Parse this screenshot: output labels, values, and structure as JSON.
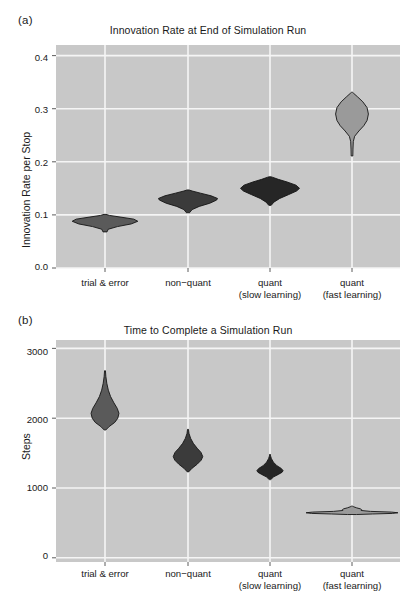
{
  "figure": {
    "background": "#ffffff",
    "panel_background": "#c8c8c8",
    "gridline_color": "#f5f5f5",
    "text_color": "#1a1a1a"
  },
  "panels": [
    {
      "tag": "(a)",
      "title": "Innovation Rate at End of Simulation Run",
      "ylabel": "Innovation Rate per Stop",
      "ytick_labels": [
        "0.4",
        "0.3",
        "0.2",
        "0.1",
        "0.0"
      ],
      "xtick_labels": [
        {
          "line1": "trial & error",
          "line2": ""
        },
        {
          "line1": "non−quant",
          "line2": ""
        },
        {
          "line1": "quant",
          "line2": "(slow learning)"
        },
        {
          "line1": "quant",
          "line2": "(fast learning)"
        }
      ]
    },
    {
      "tag": "(b)",
      "title": "Time to Complete a Simulation Run",
      "ylabel": "Steps",
      "ytick_labels": [
        "3000",
        "2000",
        "1000",
        "0"
      ],
      "xtick_labels": [
        {
          "line1": "trial & error",
          "line2": ""
        },
        {
          "line1": "non−quant",
          "line2": ""
        },
        {
          "line1": "quant",
          "line2": "(slow learning)"
        },
        {
          "line1": "quant",
          "line2": "(fast learning)"
        }
      ]
    }
  ],
  "chart_data": [
    {
      "type": "violin",
      "panel": "a",
      "title": "Innovation Rate at End of Simulation Run",
      "xlabel": "",
      "ylabel": "Innovation Rate per Stop",
      "ylim": [
        0.0,
        0.42
      ],
      "yticks": [
        0.0,
        0.1,
        0.2,
        0.3,
        0.4
      ],
      "grid": true,
      "legend": "none",
      "categories": [
        "trial & error",
        "non−quant",
        "quant (slow learning)",
        "quant (fast learning)"
      ],
      "violins": [
        {
          "name": "trial & error",
          "fill": "#5a5a5a",
          "min": 0.068,
          "max": 0.101,
          "median": 0.088,
          "half_width_max": 0.4,
          "profile": [
            {
              "v": 0.068,
              "w": 0.06
            },
            {
              "v": 0.073,
              "w": 0.1
            },
            {
              "v": 0.078,
              "w": 0.38
            },
            {
              "v": 0.083,
              "w": 0.8
            },
            {
              "v": 0.088,
              "w": 1.0
            },
            {
              "v": 0.092,
              "w": 0.88
            },
            {
              "v": 0.096,
              "w": 0.46
            },
            {
              "v": 0.099,
              "w": 0.14
            },
            {
              "v": 0.101,
              "w": 0.03
            }
          ]
        },
        {
          "name": "non−quant",
          "fill": "#3b3b3b",
          "min": 0.104,
          "max": 0.147,
          "median": 0.13,
          "half_width_max": 0.36,
          "profile": [
            {
              "v": 0.104,
              "w": 0.05
            },
            {
              "v": 0.11,
              "w": 0.14
            },
            {
              "v": 0.116,
              "w": 0.38
            },
            {
              "v": 0.122,
              "w": 0.74
            },
            {
              "v": 0.128,
              "w": 0.97
            },
            {
              "v": 0.131,
              "w": 1.0
            },
            {
              "v": 0.136,
              "w": 0.78
            },
            {
              "v": 0.141,
              "w": 0.42
            },
            {
              "v": 0.145,
              "w": 0.14
            },
            {
              "v": 0.147,
              "w": 0.03
            }
          ]
        },
        {
          "name": "quant (slow learning)",
          "fill": "#262626",
          "min": 0.118,
          "max": 0.172,
          "median": 0.15,
          "half_width_max": 0.36,
          "profile": [
            {
              "v": 0.118,
              "w": 0.04
            },
            {
              "v": 0.124,
              "w": 0.13
            },
            {
              "v": 0.131,
              "w": 0.33
            },
            {
              "v": 0.138,
              "w": 0.62
            },
            {
              "v": 0.145,
              "w": 0.9
            },
            {
              "v": 0.15,
              "w": 1.0
            },
            {
              "v": 0.156,
              "w": 0.88
            },
            {
              "v": 0.162,
              "w": 0.58
            },
            {
              "v": 0.167,
              "w": 0.28
            },
            {
              "v": 0.171,
              "w": 0.08
            },
            {
              "v": 0.172,
              "w": 0.02
            }
          ]
        },
        {
          "name": "quant (fast learning)",
          "fill": "#9a9a9a",
          "min": 0.211,
          "max": 0.331,
          "median": 0.292,
          "half_width_max": 0.2,
          "profile": [
            {
              "v": 0.211,
              "w": 0.05
            },
            {
              "v": 0.224,
              "w": 0.06
            },
            {
              "v": 0.238,
              "w": 0.08
            },
            {
              "v": 0.248,
              "w": 0.16
            },
            {
              "v": 0.258,
              "w": 0.42
            },
            {
              "v": 0.268,
              "w": 0.72
            },
            {
              "v": 0.278,
              "w": 0.92
            },
            {
              "v": 0.29,
              "w": 1.0
            },
            {
              "v": 0.302,
              "w": 0.92
            },
            {
              "v": 0.313,
              "w": 0.66
            },
            {
              "v": 0.322,
              "w": 0.35
            },
            {
              "v": 0.329,
              "w": 0.1
            },
            {
              "v": 0.331,
              "w": 0.02
            }
          ]
        }
      ]
    },
    {
      "type": "violin",
      "panel": "b",
      "title": "Time to Complete a Simulation Run",
      "xlabel": "",
      "ylabel": "Steps",
      "ylim": [
        -60,
        3120
      ],
      "yticks": [
        0,
        1000,
        2000,
        3000
      ],
      "grid": true,
      "legend": "none",
      "categories": [
        "trial & error",
        "non−quant",
        "quant (slow learning)",
        "quant (fast learning)"
      ],
      "violins": [
        {
          "name": "trial & error",
          "fill": "#5a5a5a",
          "min": 1830,
          "max": 2680,
          "median": 2080,
          "half_width_max": 0.17,
          "profile": [
            {
              "v": 1830,
              "w": 0.05
            },
            {
              "v": 1880,
              "w": 0.3
            },
            {
              "v": 1940,
              "w": 0.7
            },
            {
              "v": 2000,
              "w": 0.92
            },
            {
              "v": 2070,
              "w": 1.0
            },
            {
              "v": 2140,
              "w": 0.88
            },
            {
              "v": 2220,
              "w": 0.64
            },
            {
              "v": 2310,
              "w": 0.4
            },
            {
              "v": 2400,
              "w": 0.24
            },
            {
              "v": 2500,
              "w": 0.13
            },
            {
              "v": 2600,
              "w": 0.06
            },
            {
              "v": 2680,
              "w": 0.02
            }
          ]
        },
        {
          "name": "non−quant",
          "fill": "#3b3b3b",
          "min": 1230,
          "max": 1840,
          "median": 1450,
          "half_width_max": 0.18,
          "profile": [
            {
              "v": 1230,
              "w": 0.04
            },
            {
              "v": 1280,
              "w": 0.26
            },
            {
              "v": 1340,
              "w": 0.62
            },
            {
              "v": 1400,
              "w": 0.9
            },
            {
              "v": 1450,
              "w": 1.0
            },
            {
              "v": 1510,
              "w": 0.88
            },
            {
              "v": 1570,
              "w": 0.62
            },
            {
              "v": 1640,
              "w": 0.36
            },
            {
              "v": 1710,
              "w": 0.18
            },
            {
              "v": 1780,
              "w": 0.07
            },
            {
              "v": 1840,
              "w": 0.02
            }
          ]
        },
        {
          "name": "quant (slow learning)",
          "fill": "#262626",
          "min": 1120,
          "max": 1480,
          "median": 1240,
          "half_width_max": 0.16,
          "profile": [
            {
              "v": 1120,
              "w": 0.05
            },
            {
              "v": 1160,
              "w": 0.28
            },
            {
              "v": 1195,
              "w": 0.64
            },
            {
              "v": 1225,
              "w": 0.92
            },
            {
              "v": 1248,
              "w": 1.0
            },
            {
              "v": 1280,
              "w": 0.86
            },
            {
              "v": 1320,
              "w": 0.52
            },
            {
              "v": 1370,
              "w": 0.26
            },
            {
              "v": 1420,
              "w": 0.11
            },
            {
              "v": 1460,
              "w": 0.04
            },
            {
              "v": 1480,
              "w": 0.01
            }
          ]
        },
        {
          "name": "quant (fast learning)",
          "fill": "#9a9a9a",
          "min": 620,
          "max": 740,
          "median": 650,
          "half_width_max": 0.56,
          "profile": [
            {
              "v": 620,
              "w": 0.1
            },
            {
              "v": 628,
              "w": 0.45
            },
            {
              "v": 636,
              "w": 0.88
            },
            {
              "v": 645,
              "w": 1.0
            },
            {
              "v": 655,
              "w": 0.86
            },
            {
              "v": 665,
              "w": 0.4
            },
            {
              "v": 678,
              "w": 0.2
            },
            {
              "v": 690,
              "w": 0.21
            },
            {
              "v": 702,
              "w": 0.18
            },
            {
              "v": 716,
              "w": 0.1
            },
            {
              "v": 730,
              "w": 0.04
            },
            {
              "v": 740,
              "w": 0.01
            }
          ]
        }
      ]
    }
  ]
}
